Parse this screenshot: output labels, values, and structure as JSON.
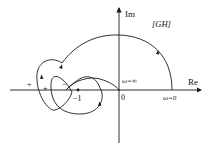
{
  "labels": {
    "im_axis": "Im",
    "re_axis": "Re",
    "plane": "[GH]",
    "origin": "0",
    "minus_one": "−1",
    "omega_zero": "ω=0",
    "omega_inf": "ω=∞",
    "plus_1": "+",
    "plus_2": "+",
    "minus_crossing": "−"
  },
  "colors": {
    "stroke": "#1a1a1a",
    "background": "#ffffff"
  }
}
